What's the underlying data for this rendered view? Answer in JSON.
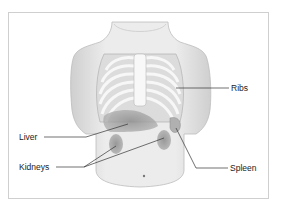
{
  "figure": {
    "labels": {
      "ribs": "Ribs",
      "liver": "Liver",
      "kidneys": "Kidneys",
      "spleen": "Spleen"
    },
    "colors": {
      "skin": "#e9e9e9",
      "skin_shadow": "#cfcfcf",
      "ribs": "#f6f6f6",
      "organ": "#9a9a9a",
      "leader_line": "#333333",
      "frame_border": "#cfcfcf"
    }
  }
}
